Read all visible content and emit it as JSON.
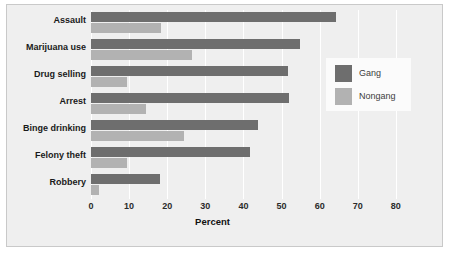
{
  "chart_data": {
    "type": "bar",
    "orientation": "horizontal",
    "title": "",
    "xlabel": "Percent",
    "ylabel": "",
    "xlim": [
      0,
      90
    ],
    "xticks": [
      0,
      10,
      20,
      30,
      40,
      50,
      60,
      70,
      80
    ],
    "grid": true,
    "legend_position": "right",
    "categories": [
      "Assault",
      "Marijuana use",
      "Drug selling",
      "Arrest",
      "Binge drinking",
      "Felony theft",
      "Robbery"
    ],
    "series": [
      {
        "name": "Gang",
        "color": "#6e6e6e",
        "values": [
          64.3,
          54.9,
          51.7,
          52.0,
          43.8,
          41.7,
          18.1
        ]
      },
      {
        "name": "Nongang",
        "color": "#b2b2b2",
        "values": [
          18.4,
          26.5,
          9.4,
          14.4,
          24.4,
          9.4,
          2.0
        ]
      }
    ]
  },
  "legend": {
    "items": [
      {
        "label": "Gang"
      },
      {
        "label": "Nongang"
      }
    ]
  },
  "axis": {
    "tick_labels": [
      "0",
      "10",
      "20",
      "30",
      "40",
      "50",
      "60",
      "70",
      "80"
    ],
    "x_title": "Percent"
  }
}
